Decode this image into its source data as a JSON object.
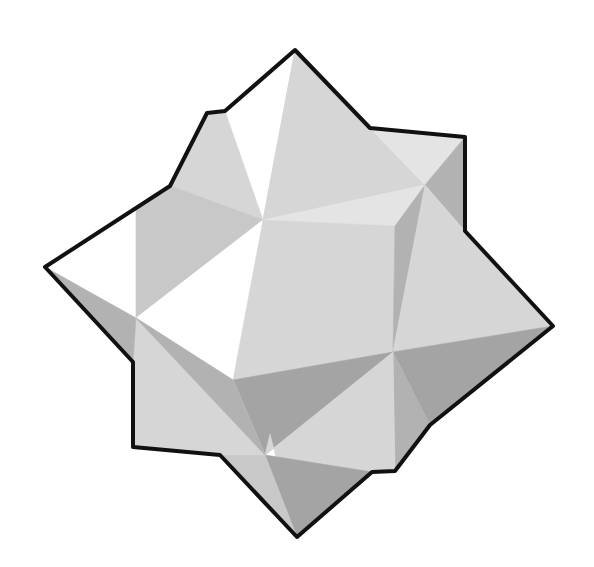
{
  "figure": {
    "background": "#ffffff",
    "outline_color": "#111111",
    "outline_width": 4,
    "shades": {
      "white": "#ffffff",
      "lightest": "#e4e4e4",
      "light": "#d6d6d6",
      "mid": "#c8c8c8",
      "dark": "#b2b2b2",
      "darker": "#a4a4a4"
    },
    "faces": [
      {
        "name": "upper-left-white-face",
        "points": "45,267 170,186 207,113 225,111 295,50 263,220 136,208 136,318",
        "shade": "white"
      },
      {
        "name": "top-left-small-face",
        "points": "170,186 207,113 225,111 263,220 136,208",
        "shade": "light"
      },
      {
        "name": "top-left-triangle",
        "points": "136,208 170,186 263,220",
        "shade": "mid"
      },
      {
        "name": "left-inner-face",
        "points": "136,208 263,220 136,318",
        "shade": "mid"
      },
      {
        "name": "top-right-face",
        "points": "295,50 370,128 425,185 263,220",
        "shade": "light"
      },
      {
        "name": "top-right-upper-tri",
        "points": "295,50 370,128 263,220",
        "shade": "light"
      },
      {
        "name": "upper-cube-face",
        "points": "370,128 465,137 425,185",
        "shade": "lightest"
      },
      {
        "name": "right-cube-side",
        "points": "465,137 465,231 425,185",
        "shade": "dark"
      },
      {
        "name": "center-band-light",
        "points": "263,220 425,185 395,226",
        "shade": "lightest"
      },
      {
        "name": "center-white-face",
        "points": "136,318 263,220 233,380",
        "shade": "white"
      },
      {
        "name": "center-large-face",
        "points": "263,220 395,226 393,352 233,380",
        "shade": "light"
      },
      {
        "name": "right-thin-face",
        "points": "395,226 425,185 393,352",
        "shade": "dark"
      },
      {
        "name": "right-upper-face",
        "points": "425,185 465,231 553,326 393,352",
        "shade": "light"
      },
      {
        "name": "right-lower-face",
        "points": "393,352 553,326 430,425",
        "shade": "darker"
      },
      {
        "name": "right-lower-thin",
        "points": "393,352 430,425 395,471",
        "shade": "dark"
      },
      {
        "name": "bottom-right-face",
        "points": "393,352 395,471 372,472 325,480 270,434",
        "shade": "light"
      },
      {
        "name": "bottom-center-dark",
        "points": "233,380 393,352 265,455",
        "shade": "darker"
      },
      {
        "name": "bottom-mid-light",
        "points": "265,455 393,352 372,472 297,537 270,434",
        "shade": "light"
      },
      {
        "name": "bottom-point-face",
        "points": "265,455 372,472 297,537",
        "shade": "darker"
      },
      {
        "name": "bottom-point-left",
        "points": "220,455 265,455 297,537",
        "shade": "mid"
      },
      {
        "name": "left-lower-face",
        "points": "136,318 233,380 265,455 220,455 133,447 133,362",
        "shade": "light"
      },
      {
        "name": "left-lower-dark-strip",
        "points": "136,318 265,455 233,380",
        "shade": "dark"
      },
      {
        "name": "left-edge-shadow",
        "points": "45,267 136,318 133,362",
        "shade": "dark"
      }
    ],
    "outline_points": "45,267 170,186 207,113 225,111 295,50 370,128 465,137 465,231 553,326 430,425 395,471 372,472 297,537 220,455 133,447 133,362"
  }
}
